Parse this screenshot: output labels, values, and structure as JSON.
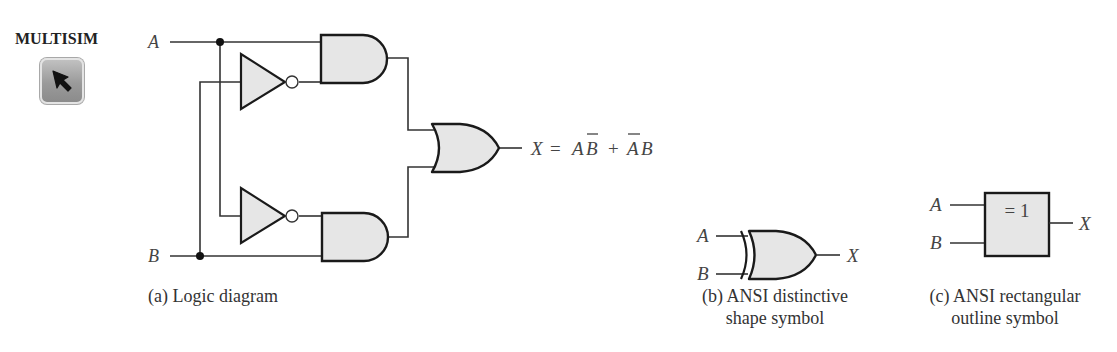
{
  "tool": {
    "label": "MULTISIM",
    "icon": "cursor-arrow-icon"
  },
  "logic_diagram": {
    "inputs": [
      "A",
      "B"
    ],
    "output_expression": {
      "lhs": "X",
      "equals": "=",
      "term1": [
        "A",
        "B̄"
      ],
      "plus": "+",
      "term2": [
        "Ā",
        "B"
      ],
      "text": "X = AB̄ + ĀB"
    },
    "gates": [
      "NOT",
      "NOT",
      "AND",
      "AND",
      "OR"
    ],
    "caption": "(a) Logic diagram"
  },
  "ansi_distinctive": {
    "inputs": [
      "A",
      "B"
    ],
    "output": "X",
    "gate": "XOR",
    "caption_line1": "(b) ANSI distinctive",
    "caption_line2": "shape symbol"
  },
  "ansi_rectangular": {
    "inputs": [
      "A",
      "B"
    ],
    "output": "X",
    "box_label": "= 1",
    "caption_line1": "(c) ANSI rectangular",
    "caption_line2": "outline symbol"
  },
  "colors": {
    "gate_fill": "#e6e6e6",
    "stroke": "#1a1a1a",
    "wire": "#333333",
    "text": "#444444"
  }
}
